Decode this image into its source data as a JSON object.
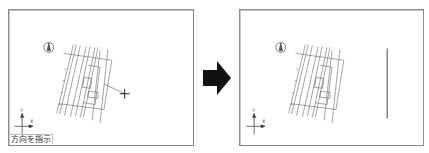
{
  "panels": [
    {
      "id": "before",
      "status_prompt": "方向を指示",
      "has_cursor": true,
      "has_result_line": false
    },
    {
      "id": "after",
      "status_prompt": "",
      "has_cursor": false,
      "has_result_line": true
    }
  ],
  "axis_labels": {
    "x": "X",
    "y": "Y"
  },
  "icons": {
    "north_marker": "north-arrow-icon",
    "ucs": "ucs-axis-icon",
    "cursor": "crosshair-cursor-icon",
    "transition": "right-arrow-icon"
  },
  "colors": {
    "frame_border": "#8a8a8a",
    "drawing_line": "#555555",
    "result_line": "#444444",
    "arrow_fill": "#111111",
    "text": "#333333"
  }
}
